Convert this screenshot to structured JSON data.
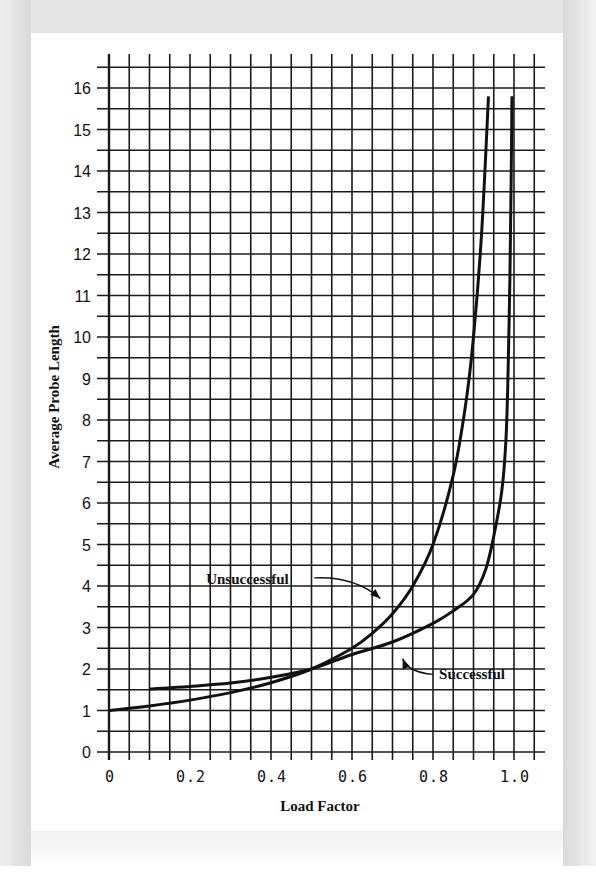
{
  "chart_data": {
    "type": "line",
    "title": "",
    "xlabel": "Load Factor",
    "ylabel": "Average Probe Length",
    "xlim": [
      0,
      1.05
    ],
    "ylim": [
      0,
      16.5
    ],
    "grid": true,
    "x_ticks": [
      "0",
      "0.2",
      "0.4",
      "0.6",
      "0.8",
      "1.0"
    ],
    "x_tick_values": [
      0,
      0.2,
      0.4,
      0.6,
      0.8,
      1.0
    ],
    "y_ticks": [
      "0",
      "1",
      "2",
      "3",
      "4",
      "5",
      "6",
      "7",
      "8",
      "9",
      "10",
      "11",
      "12",
      "13",
      "14",
      "15",
      "16"
    ],
    "y_tick_values": [
      0,
      1,
      2,
      3,
      4,
      5,
      6,
      7,
      8,
      9,
      10,
      11,
      12,
      13,
      14,
      15,
      16
    ],
    "legend_position": "inline annotations with arrows",
    "series": [
      {
        "name": "Unsuccessful",
        "x": [
          0,
          0.1,
          0.2,
          0.3,
          0.4,
          0.5,
          0.6,
          0.65,
          0.7,
          0.75,
          0.8,
          0.85,
          0.88,
          0.9,
          0.92,
          0.937
        ],
        "y": [
          1.0,
          1.11,
          1.25,
          1.43,
          1.67,
          2.0,
          2.5,
          2.86,
          3.33,
          4.0,
          5.0,
          6.67,
          8.33,
          10.0,
          12.5,
          15.8
        ]
      },
      {
        "name": "Successful",
        "x": [
          0.1,
          0.2,
          0.3,
          0.4,
          0.5,
          0.6,
          0.7,
          0.8,
          0.85,
          0.9,
          0.93,
          0.95,
          0.97,
          0.98,
          0.985,
          0.99,
          0.993,
          0.995
        ],
        "y": [
          1.52,
          1.58,
          1.66,
          1.8,
          2.0,
          2.35,
          2.65,
          3.1,
          3.4,
          3.8,
          4.4,
          5.2,
          6.3,
          7.5,
          9.0,
          11.5,
          13.8,
          15.8
        ]
      }
    ],
    "annotations": [
      {
        "text": "Unsuccessful",
        "series": "Unsuccessful",
        "label_at": [
          0.24,
          4.05
        ],
        "arrow_to": [
          0.67,
          3.7
        ]
      },
      {
        "text": "Successful",
        "series": "Successful",
        "label_at": [
          0.815,
          1.75
        ],
        "arrow_to": [
          0.725,
          2.25
        ]
      }
    ]
  }
}
